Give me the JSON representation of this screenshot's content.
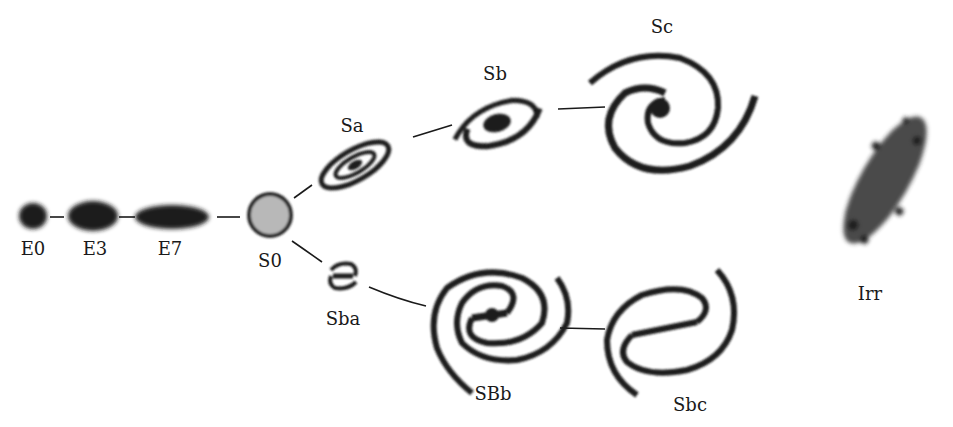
{
  "colors": {
    "ink": "#1a1a1a",
    "background": "#ffffff",
    "s0_fill": "#b8b8b8"
  },
  "elliptical_sequence": [
    {
      "id": "E0",
      "label": "E0",
      "x": 33,
      "y": 216,
      "label_y": 240
    },
    {
      "id": "E3",
      "label": "E3",
      "x": 93,
      "y": 216,
      "label_y": 240
    },
    {
      "id": "E7",
      "label": "E7",
      "x": 172,
      "y": 216,
      "label_y": 240
    }
  ],
  "lenticular": {
    "id": "S0",
    "label": "S0",
    "x": 270,
    "y": 215,
    "label_y": 252
  },
  "normal_spirals": [
    {
      "id": "Sa",
      "label": "Sa",
      "x": 355,
      "y": 165,
      "label_x": 352,
      "label_y": 117
    },
    {
      "id": "Sb",
      "label": "Sb",
      "x": 495,
      "y": 122,
      "label_x": 495,
      "label_y": 65
    },
    {
      "id": "Sc",
      "label": "Sc",
      "x": 660,
      "y": 105,
      "label_x": 662,
      "label_y": 18
    }
  ],
  "barred_spirals": [
    {
      "id": "Sba",
      "label": "Sba",
      "x": 343,
      "y": 276,
      "label_x": 343,
      "label_y": 310
    },
    {
      "id": "SBb",
      "label": "SBb",
      "x": 492,
      "y": 318,
      "label_x": 493,
      "label_y": 385
    },
    {
      "id": "Sbc",
      "label": "Sbc",
      "x": 672,
      "y": 330,
      "label_x": 690,
      "label_y": 396
    }
  ],
  "irregular": {
    "id": "Irr",
    "label": "Irr",
    "x": 888,
    "y": 180,
    "label_x": 870,
    "label_y": 285
  }
}
